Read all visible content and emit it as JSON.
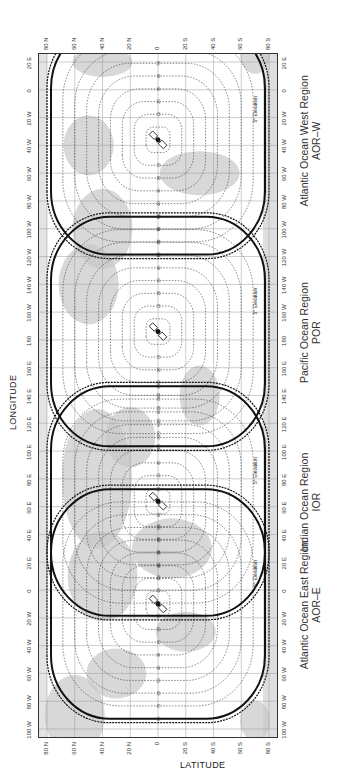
{
  "axes": {
    "latitude_title": "LATITUDE",
    "longitude_title": "LONGITUDE",
    "latitude_ticks": [
      "80 N",
      "60 N",
      "40 N",
      "20 N",
      "0",
      "20 S",
      "40 S",
      "60 S",
      "80 S"
    ],
    "longitude_ticks": [
      "100 W",
      "80 W",
      "60 W",
      "40 W",
      "20 W",
      "0",
      "20 E",
      "40 E",
      "60 E",
      "80 E",
      "100 E",
      "120 E",
      "140 E",
      "160 E",
      "180",
      "160 W",
      "140 W",
      "120 W",
      "100 W",
      "80 W",
      "60 W",
      "40 W",
      "20 W",
      "0",
      "20 E"
    ]
  },
  "regions": [
    {
      "name": "Atlantic Ocean East Region",
      "code": "AOR–E",
      "center_lon_index": 4.5
    },
    {
      "name": "Indian Ocean Region",
      "code": "IOR",
      "center_lon_index": 8.2
    },
    {
      "name": "Pacific Ocean Region",
      "code": "POR",
      "center_lon_index": 14.3
    },
    {
      "name": "Atlantic Ocean West Region",
      "code": "AOR–W",
      "center_lon_index": 21.2
    }
  ],
  "boundary_label": "5° Elevation",
  "contour_labels": [
    "10",
    "20",
    "30",
    "40",
    "50",
    "60",
    "70",
    "80"
  ],
  "colors": {
    "land": "#c8c8c8",
    "line": "#111111",
    "grid": "#9a9a9a",
    "dotted": "#333333"
  }
}
